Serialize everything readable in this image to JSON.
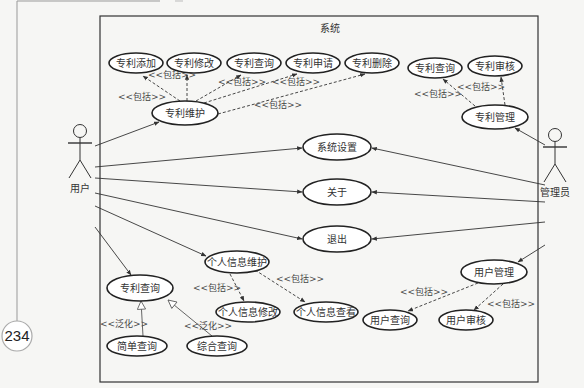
{
  "page": {
    "number": "234"
  },
  "system": {
    "title": "系统",
    "box": {
      "x": 100,
      "y": 16,
      "w": 438,
      "h": 366
    }
  },
  "actors": [
    {
      "id": "user",
      "label": "用户",
      "x": 80,
      "y": 148
    },
    {
      "id": "admin",
      "label": "管理员",
      "x": 555,
      "y": 152
    }
  ],
  "use_cases": [
    {
      "id": "add",
      "label": "专利添加",
      "cx": 136,
      "cy": 63,
      "rx": 27,
      "ry": 10
    },
    {
      "id": "modify",
      "label": "专利修改",
      "cx": 194,
      "cy": 63,
      "rx": 27,
      "ry": 10
    },
    {
      "id": "query1",
      "label": "专利查询",
      "cx": 254,
      "cy": 63,
      "rx": 27,
      "ry": 10
    },
    {
      "id": "apply",
      "label": "专利申请",
      "cx": 313,
      "cy": 63,
      "rx": 27,
      "ry": 10
    },
    {
      "id": "delete",
      "label": "专利删除",
      "cx": 372,
      "cy": 63,
      "rx": 27,
      "ry": 10
    },
    {
      "id": "maintain",
      "label": "专利维护",
      "cx": 185,
      "cy": 113,
      "rx": 33,
      "ry": 12
    },
    {
      "id": "query2",
      "label": "专利查询",
      "cx": 435,
      "cy": 68,
      "rx": 27,
      "ry": 10
    },
    {
      "id": "audit",
      "label": "专利审核",
      "cx": 495,
      "cy": 66,
      "rx": 27,
      "ry": 10
    },
    {
      "id": "patent_mgmt",
      "label": "专利管理",
      "cx": 495,
      "cy": 117,
      "rx": 33,
      "ry": 12
    },
    {
      "id": "settings",
      "label": "系统设置",
      "cx": 337,
      "cy": 147,
      "rx": 34,
      "ry": 13
    },
    {
      "id": "about",
      "label": "关于",
      "cx": 337,
      "cy": 192,
      "rx": 34,
      "ry": 13
    },
    {
      "id": "exit",
      "label": "退出",
      "cx": 337,
      "cy": 239,
      "rx": 34,
      "ry": 13
    },
    {
      "id": "personal",
      "label": "个人信息维护",
      "cx": 237,
      "cy": 262,
      "rx": 32,
      "ry": 11
    },
    {
      "id": "patent_query",
      "label": "专利查询",
      "cx": 140,
      "cy": 288,
      "rx": 33,
      "ry": 13
    },
    {
      "id": "personal_edit",
      "label": "个人信息修改",
      "cx": 248,
      "cy": 312,
      "rx": 32,
      "ry": 10
    },
    {
      "id": "personal_view",
      "label": "个人信息查看",
      "cx": 326,
      "cy": 312,
      "rx": 32,
      "ry": 10
    },
    {
      "id": "simple_query",
      "label": "简单查询",
      "cx": 137,
      "cy": 346,
      "rx": 30,
      "ry": 10
    },
    {
      "id": "combined_query",
      "label": "综合查询",
      "cx": 217,
      "cy": 346,
      "rx": 30,
      "ry": 10
    },
    {
      "id": "user_mgmt",
      "label": "用户管理",
      "cx": 494,
      "cy": 272,
      "rx": 33,
      "ry": 12
    },
    {
      "id": "user_query",
      "label": "用户查询",
      "cx": 390,
      "cy": 320,
      "rx": 27,
      "ry": 10
    },
    {
      "id": "user_audit",
      "label": "用户审核",
      "cx": 466,
      "cy": 320,
      "rx": 27,
      "ry": 10
    }
  ],
  "associations": [
    {
      "from": "user",
      "x1": 95,
      "y1": 146,
      "x2": 159,
      "y2": 122
    },
    {
      "from": "user",
      "x1": 95,
      "y1": 167,
      "x2": 302,
      "y2": 148
    },
    {
      "from": "user",
      "x1": 95,
      "y1": 178,
      "x2": 302,
      "y2": 192
    },
    {
      "from": "user",
      "x1": 95,
      "y1": 193,
      "x2": 302,
      "y2": 239
    },
    {
      "from": "user",
      "x1": 95,
      "y1": 206,
      "x2": 206,
      "y2": 256
    },
    {
      "from": "user",
      "x1": 95,
      "y1": 227,
      "x2": 131,
      "y2": 275
    },
    {
      "from": "admin",
      "x1": 545,
      "y1": 145,
      "x2": 515,
      "y2": 128
    },
    {
      "from": "admin",
      "x1": 545,
      "y1": 185,
      "x2": 372,
      "y2": 148
    },
    {
      "from": "admin",
      "x1": 545,
      "y1": 202,
      "x2": 372,
      "y2": 192
    },
    {
      "from": "admin",
      "x1": 545,
      "y1": 222,
      "x2": 372,
      "y2": 239
    },
    {
      "from": "admin",
      "x1": 545,
      "y1": 245,
      "x2": 518,
      "y2": 262
    }
  ],
  "includes": [
    {
      "x1": 180,
      "y1": 101,
      "x2": 143,
      "y2": 76,
      "label": "<<包括>>",
      "lx": 148,
      "ly": 78
    },
    {
      "x1": 187,
      "y1": 101,
      "x2": 187,
      "y2": 75,
      "label": "<<包括>>",
      "lx": 118,
      "ly": 100
    },
    {
      "x1": 196,
      "y1": 101,
      "x2": 241,
      "y2": 75,
      "label": "<<包括>>",
      "lx": 218,
      "ly": 85
    },
    {
      "x1": 204,
      "y1": 103,
      "x2": 297,
      "y2": 74,
      "label": "<<包括>>",
      "lx": 272,
      "ly": 85
    },
    {
      "x1": 218,
      "y1": 114,
      "x2": 365,
      "y2": 74,
      "label": "<<包括>>",
      "lx": 254,
      "ly": 108
    },
    {
      "x1": 475,
      "y1": 106,
      "x2": 443,
      "y2": 79,
      "label": "<<包括>>",
      "lx": 414,
      "ly": 97
    },
    {
      "x1": 505,
      "y1": 105,
      "x2": 501,
      "y2": 77,
      "label": "<<包括>>",
      "lx": 457,
      "ly": 90
    },
    {
      "x1": 230,
      "y1": 274,
      "x2": 244,
      "y2": 301,
      "label": "<<包括>>",
      "lx": 193,
      "ly": 291
    },
    {
      "x1": 255,
      "y1": 270,
      "x2": 305,
      "y2": 302,
      "label": "<<包括>>",
      "lx": 276,
      "ly": 282
    },
    {
      "x1": 478,
      "y1": 283,
      "x2": 408,
      "y2": 311,
      "label": "<<包括>>",
      "lx": 400,
      "ly": 295
    },
    {
      "x1": 503,
      "y1": 284,
      "x2": 474,
      "y2": 310,
      "label": "<<包括>>",
      "lx": 487,
      "ly": 307
    }
  ],
  "generalizations": [
    {
      "x1": 143,
      "y1": 336,
      "x2": 141,
      "y2": 301,
      "label": "<<泛化>>",
      "lx": 100,
      "ly": 327
    },
    {
      "x1": 212,
      "y1": 336,
      "x2": 168,
      "y2": 300,
      "label": "<<泛化>>",
      "lx": 184,
      "ly": 329
    }
  ],
  "colors": {
    "line": "#333333",
    "background": "#f6f6f4",
    "ellipse_fill": "#ffffff"
  }
}
